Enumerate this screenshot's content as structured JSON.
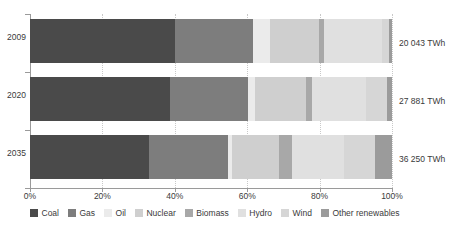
{
  "chart_data": {
    "type": "bar",
    "orientation": "horizontal",
    "stacked": true,
    "normalized_percent": true,
    "title": "",
    "subtitle": "",
    "xlabel": "",
    "ylabel": "",
    "xlim": [
      0,
      100
    ],
    "grid": true,
    "grid_axis": "x",
    "legend_position": "bottom",
    "categories": [
      "2009",
      "2020",
      "2035"
    ],
    "xtick_labels": [
      "0%",
      "20%",
      "40%",
      "60%",
      "80%",
      "100%"
    ],
    "xtick_values": [
      0,
      20,
      40,
      60,
      80,
      100
    ],
    "row_totals": [
      "20 043 TWh",
      "27 881 TWh",
      "36 250 TWh"
    ],
    "series": [
      {
        "name": "Coal",
        "color": "#4a4a4a",
        "values": [
          40.0,
          38.8,
          32.8
        ]
      },
      {
        "name": "Gas",
        "color": "#7d7d7d",
        "values": [
          21.5,
          21.4,
          21.9
        ]
      },
      {
        "name": "Oil",
        "color": "#ebebeb",
        "values": [
          4.9,
          2.0,
          1.2
        ]
      },
      {
        "name": "Nuclear",
        "color": "#cfcfcf",
        "values": [
          13.4,
          14.0,
          13.0
        ]
      },
      {
        "name": "Biomass",
        "color": "#a8a8a8",
        "values": [
          1.3,
          1.7,
          3.6
        ]
      },
      {
        "name": "Hydro",
        "color": "#e0e0e0",
        "values": [
          16.2,
          14.8,
          14.2
        ]
      },
      {
        "name": "Wind",
        "color": "#d6d6d6",
        "values": [
          1.8,
          5.8,
          8.6
        ]
      },
      {
        "name": "Other renewables",
        "color": "#9b9b9b",
        "values": [
          0.9,
          1.5,
          4.7
        ]
      }
    ]
  },
  "legend": {
    "items": [
      {
        "label": "Coal"
      },
      {
        "label": "Gas"
      },
      {
        "label": "Oil"
      },
      {
        "label": "Nuclear"
      },
      {
        "label": "Biomass"
      },
      {
        "label": "Hydro"
      },
      {
        "label": "Wind"
      },
      {
        "label": "Other renewables"
      }
    ]
  },
  "axis": {
    "y_labels": [
      "2009",
      "2020",
      "2035"
    ],
    "x_labels": [
      "0%",
      "20%",
      "40%",
      "60%",
      "80%",
      "100%"
    ]
  },
  "values": {
    "row0": "20 043 TWh",
    "row1": "27 881 TWh",
    "row2": "36 250 TWh"
  },
  "colors": {
    "axis": "#9a9a9a",
    "grid": "#c9c9c9",
    "text": "#3a3a3a",
    "background": "#ffffff"
  }
}
